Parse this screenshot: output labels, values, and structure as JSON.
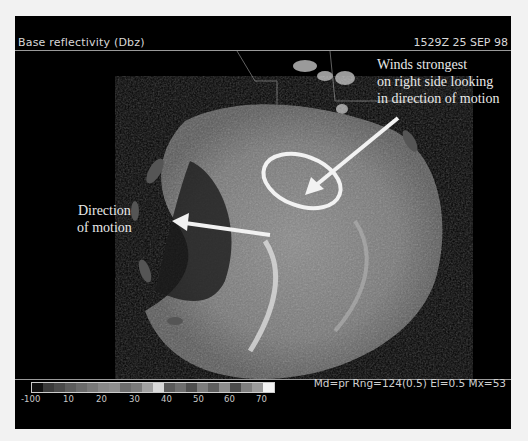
{
  "header": {
    "product_title": "Base reflectivity (Dbz)",
    "timestamp": "1529Z 25 SEP 98"
  },
  "annotations": {
    "winds_strongest": [
      "Winds strongest",
      "on right side looking",
      "in direction of motion"
    ],
    "direction_of_motion": [
      "Direction",
      "of motion"
    ]
  },
  "legend": {
    "scale_labels": [
      "-100",
      "10",
      "20",
      "30",
      "40",
      "50",
      "60",
      "70"
    ],
    "colors": [
      "#111111",
      "#3a3a3a",
      "#4a4a4a",
      "#5c5c5c",
      "#6a6a6a",
      "#787878",
      "#888888",
      "#8e8e8e",
      "#6c6c6c",
      "#7a7a7a",
      "#a0a0a0",
      "#d8d8d8",
      "#5a5a5a",
      "#6e6e6e",
      "#4e4e4e",
      "#7c7c7c",
      "#5e5e5e",
      "#8c8c8c",
      "#4c4c4c",
      "#7e7e7e",
      "#9a9a9a",
      "#f4f4f4"
    ]
  },
  "footer": {
    "radar_params": "Md=pr Rng=124(0.5) El=0.5 Mx=53"
  }
}
